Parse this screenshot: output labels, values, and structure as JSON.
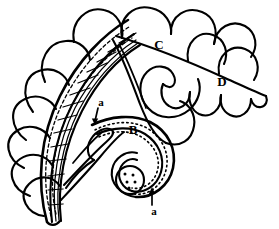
{
  "figure": {
    "kind": "line-art pattern diagram",
    "background_color": "#ffffff",
    "ink_color": "#000000",
    "width": 279,
    "height": 229
  },
  "labels": [
    {
      "id": "C",
      "text": "C",
      "x": 159,
      "y": 46,
      "case": "upper",
      "refers_to": "upper large scroll leaf"
    },
    {
      "id": "D",
      "text": "D",
      "x": 222,
      "y": 83,
      "case": "upper",
      "refers_to": "right scalloped leaf tail"
    },
    {
      "id": "B",
      "text": "B",
      "x": 133,
      "y": 131,
      "case": "upper",
      "refers_to": "dotted inner scroll band"
    },
    {
      "id": "a-upper",
      "text": "a",
      "x": 101,
      "y": 103,
      "case": "lower",
      "refers_to": "band edge, upper arrow"
    },
    {
      "id": "a-lower",
      "text": "a",
      "x": 154,
      "y": 212,
      "case": "lower",
      "refers_to": "band edge, lower arrow"
    }
  ],
  "annotations": {
    "arrows": [
      {
        "id": "arrow-upper",
        "from_x": 98,
        "from_y": 108,
        "to_x": 95,
        "to_y": 123,
        "direction": "down",
        "label": "a"
      },
      {
        "id": "arrow-lower",
        "from_x": 152,
        "from_y": 205,
        "to_x": 152,
        "to_y": 189,
        "direction": "up",
        "label": "a"
      }
    ]
  },
  "regions": [
    {
      "id": "A",
      "name": "checkered-grid-band",
      "fill_style": "square lattice grid",
      "labelled": false
    },
    {
      "id": "B",
      "name": "dotted-scroll-band",
      "fill_style": "dotted midline",
      "labelled": true
    },
    {
      "id": "C",
      "name": "upper-scroll-leaf",
      "fill_style": "plain",
      "labelled": true
    },
    {
      "id": "D",
      "name": "right-scalloped-tail",
      "fill_style": "plain",
      "labelled": true
    }
  ],
  "details": {
    "scallop_count_outer": 11,
    "scallop_count_right": 4,
    "spiral_dot_count": 5,
    "dashed_guide_lines": 2
  }
}
